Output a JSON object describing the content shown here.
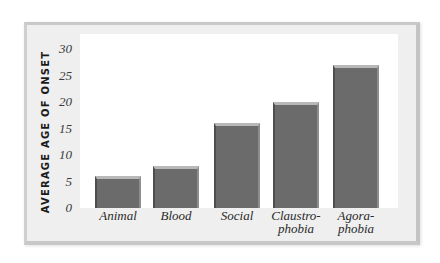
{
  "chart_data": {
    "type": "bar",
    "title": "",
    "xlabel": "",
    "ylabel": "AVERAGE AGE OF ONSET",
    "categories": [
      "Animal",
      "Blood",
      "Social",
      "Claustrophobia",
      "Agoraphobia"
    ],
    "category_labels": [
      [
        "Animal"
      ],
      [
        "Blood"
      ],
      [
        "Social"
      ],
      [
        "Claustro-",
        "phobia"
      ],
      [
        "Agora-",
        "phobia"
      ]
    ],
    "values": [
      6,
      8,
      16,
      20,
      27
    ],
    "ylim": [
      0,
      30
    ],
    "yticks": [
      "0",
      "5",
      "10",
      "15",
      "20",
      "25",
      "30"
    ],
    "grid": false,
    "legend": null,
    "bar_color": "#6b6b6b"
  }
}
